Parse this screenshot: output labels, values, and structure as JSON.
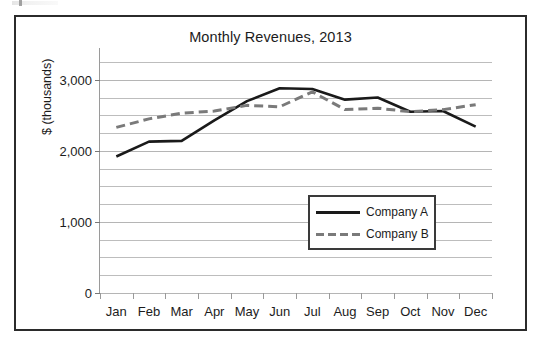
{
  "chart_data": {
    "type": "line",
    "title": "Monthly Revenues, 2013",
    "xlabel": "",
    "ylabel": "$ (thousands)",
    "categories": [
      "Jan",
      "Feb",
      "Mar",
      "Apr",
      "May",
      "Jun",
      "Jul",
      "Aug",
      "Sep",
      "Oct",
      "Nov",
      "Dec"
    ],
    "series": [
      {
        "name": "Company A",
        "style": "solid",
        "color": "#1a1a1a",
        "values": [
          1920,
          2130,
          2140,
          2430,
          2700,
          2880,
          2870,
          2720,
          2750,
          2550,
          2560,
          2340
        ]
      },
      {
        "name": "Company B",
        "style": "dashed",
        "color": "#7a7a7a",
        "values": [
          2330,
          2450,
          2530,
          2560,
          2640,
          2620,
          2830,
          2580,
          2600,
          2550,
          2580,
          2650
        ]
      }
    ],
    "ylim": [
      0,
      3250
    ],
    "ytick_labels": [
      "0",
      "1,000",
      "2,000",
      "3,000"
    ],
    "ytick_values": [
      0,
      1000,
      2000,
      3000
    ],
    "gridline_step": 250,
    "grid": true,
    "legend_position": "inside-right"
  }
}
